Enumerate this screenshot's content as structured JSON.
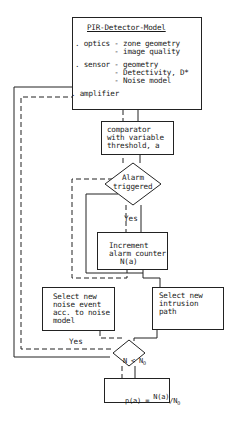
{
  "model_box": {
    "title": "PIR-Detector-Model",
    "lines": [
      ". optics - zone geometry",
      "         - image quality",
      ". sensor - geometry",
      "         - Detectivity, D*",
      "         - Noise model",
      ". amplifier"
    ]
  },
  "comparator_box": {
    "lines": [
      "comparator",
      "with variable",
      "threshold, a"
    ]
  },
  "alarm_decision": {
    "lines": [
      "Alarm",
      "triggered"
    ],
    "yes_label": "Yes"
  },
  "increment_box": {
    "lines": [
      "Increment",
      "alarm counter",
      "N(a)"
    ]
  },
  "noise_box": {
    "lines": [
      "Select new",
      "noise event",
      "acc. to noise",
      "model"
    ]
  },
  "intrusion_box": {
    "lines": [
      "Select new",
      "intrusion",
      "path"
    ]
  },
  "count_decision": {
    "label": "N < N",
    "subscript": "O",
    "yes_label": "Yes"
  },
  "result_box": {
    "lhs": "p(a) = ",
    "numerator": "N(a)",
    "slash": "/",
    "denominator": "N",
    "denominator_sub": "O"
  }
}
